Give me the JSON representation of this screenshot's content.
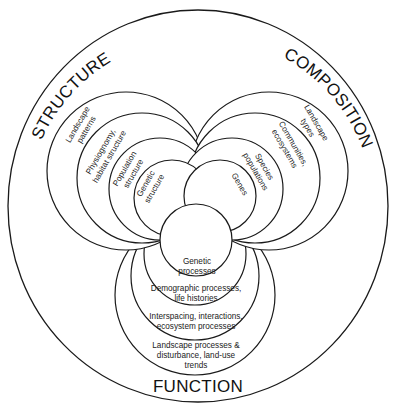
{
  "diagram": {
    "colors": {
      "stroke": "#1a1a1a",
      "fill": "#ffffff",
      "text": "#111111"
    },
    "categories": {
      "structure": "STRUCTURE",
      "composition": "COMPOSITION",
      "function": "FUNCTION"
    },
    "structure_levels": [
      {
        "line1": "Landscape",
        "line2": "patterns"
      },
      {
        "line1": "Physiognomy,",
        "line2": "habitat structure"
      },
      {
        "line1": "Population",
        "line2": "structure"
      },
      {
        "line1": "Genetic",
        "line2": "structure"
      }
    ],
    "composition_levels": [
      {
        "line1": "Landscape",
        "line2": "types"
      },
      {
        "line1": "Communities,",
        "line2": "ecosystems"
      },
      {
        "line1": "Species",
        "line2": "populations"
      },
      {
        "line1": "Genes",
        "line2": ""
      }
    ],
    "function_levels": [
      {
        "line1": "Genetic",
        "line2": "processes",
        "line3": ""
      },
      {
        "line1": "Demographic processes,",
        "line2": "life histories",
        "line3": ""
      },
      {
        "line1": "Interspacing, interactions,",
        "line2": "ecosystem processes",
        "line3": ""
      },
      {
        "line1": "Landscape processes &",
        "line2": "disturbance, land-use",
        "line3": "trends"
      }
    ]
  }
}
